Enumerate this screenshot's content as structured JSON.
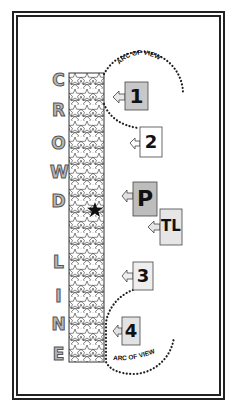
{
  "diagram": {
    "crowd_line": {
      "letters": [
        "C",
        "R",
        "O",
        "W",
        "D",
        "L",
        "I",
        "N",
        "E"
      ],
      "word_1": "CROWD",
      "word_2": "LINE",
      "fill_pattern": "stars",
      "marker": "black-star"
    },
    "arcs": {
      "top_label": "ARC OF VIEW",
      "bottom_label": "ARC OF VIEW"
    },
    "positions": [
      {
        "id": "1",
        "label": "1",
        "fill": "#c8c8c8"
      },
      {
        "id": "2",
        "label": "2",
        "fill": "#ffffff"
      },
      {
        "id": "P",
        "label": "P",
        "fill": "#bdbdbd"
      },
      {
        "id": "TL",
        "label": "TL",
        "fill": "#e6e6e6"
      },
      {
        "id": "3",
        "label": "3",
        "fill": "#eeeeee"
      },
      {
        "id": "4",
        "label": "4",
        "fill": "#e3e3e3"
      }
    ],
    "colors": {
      "border": "#222222",
      "letter_fill": "#b8b8b8",
      "letter_stroke": "#555555",
      "arc_dots": "#222222"
    }
  }
}
